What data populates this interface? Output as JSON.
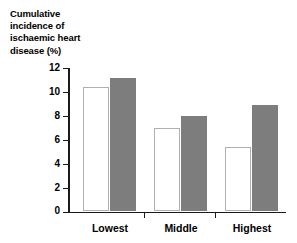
{
  "chart_data": {
    "type": "bar",
    "title": "Cumulative incidence of ischaemic heart disease (%)",
    "title_lines": [
      "Cumulative",
      "incidence of",
      "ischaemic heart",
      "disease (%)"
    ],
    "xlabel": "",
    "ylabel": "Cumulative incidence of ischaemic heart disease (%)",
    "categories": [
      "Lowest",
      "Middle",
      "Highest"
    ],
    "ylim": [
      0,
      12
    ],
    "ytick_labels": [
      "0",
      "2",
      "4",
      "6",
      "8",
      "10",
      "12"
    ],
    "ytick_values": [
      0,
      2,
      4,
      6,
      8,
      10,
      12
    ],
    "grid": false,
    "legend": "none",
    "series": [
      {
        "name": "white-bar",
        "color": "#ffffff",
        "border_color": "#b0b0b0",
        "values": [
          10.4,
          7.0,
          5.4
        ]
      },
      {
        "name": "gray-bar",
        "color": "#7d7d7d",
        "values": [
          11.2,
          8.0,
          8.9
        ]
      }
    ]
  }
}
